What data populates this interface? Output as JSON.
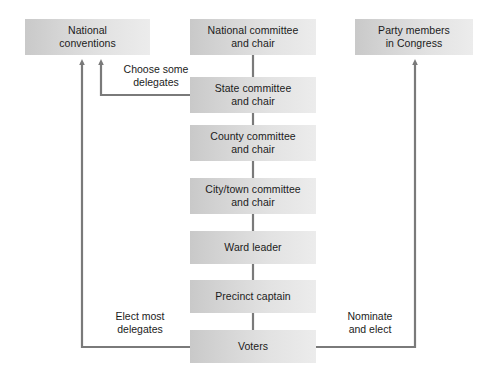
{
  "diagram": {
    "background_color": "#ffffff",
    "line_color": "#7a7a7a",
    "box_fill_left": "#c9c9c9",
    "box_fill_right": "#ececec",
    "text_color": "#1b1b1b",
    "nodes": [
      {
        "id": "national-conventions",
        "label": "National\nconventions",
        "x": 25,
        "y": 19,
        "w": 125,
        "h": 36
      },
      {
        "id": "national-committee",
        "label": "National committee\nand chair",
        "x": 190,
        "y": 19,
        "w": 126,
        "h": 36
      },
      {
        "id": "party-members-congress",
        "label": "Party members\nin Congress",
        "x": 355,
        "y": 19,
        "w": 118,
        "h": 36
      },
      {
        "id": "state-committee",
        "label": "State committee\nand chair",
        "x": 190,
        "y": 77,
        "w": 126,
        "h": 36
      },
      {
        "id": "county-committee",
        "label": "County committee\nand chair",
        "x": 190,
        "y": 125,
        "w": 126,
        "h": 36
      },
      {
        "id": "city-town-committee",
        "label": "City/town committee\nand chair",
        "x": 190,
        "y": 178,
        "w": 126,
        "h": 36
      },
      {
        "id": "ward-leader",
        "label": "Ward leader",
        "x": 190,
        "y": 231,
        "w": 126,
        "h": 33
      },
      {
        "id": "precinct-captain",
        "label": "Precinct captain",
        "x": 190,
        "y": 280,
        "w": 126,
        "h": 33
      },
      {
        "id": "voters",
        "label": "Voters",
        "x": 190,
        "y": 330,
        "w": 126,
        "h": 33
      }
    ],
    "edge_labels": [
      {
        "id": "choose-some-delegates",
        "label": "Choose some\ndelegates",
        "x": 110,
        "y": 63,
        "w": 92
      },
      {
        "id": "elect-most-delegates",
        "label": "Elect most\ndelegates",
        "x": 100,
        "y": 310,
        "w": 80
      },
      {
        "id": "nominate-and-elect",
        "label": "Nominate\nand elect",
        "x": 333,
        "y": 310,
        "w": 74
      }
    ]
  }
}
